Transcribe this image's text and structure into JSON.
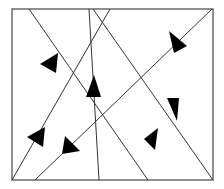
{
  "diagram": {
    "type": "directed-line-arrangement",
    "frame": {
      "x1": 12,
      "y1": 9,
      "x2": 213,
      "y2": 180,
      "stroke": "#555555"
    },
    "line_color": "#333333",
    "arrow_color": "#000000",
    "lines": [
      {
        "id": "line-1",
        "x1": 29,
        "y1": 9,
        "x2": 148,
        "y2": 180
      },
      {
        "id": "line-2",
        "x1": 89,
        "y1": 9,
        "x2": 99,
        "y2": 180
      },
      {
        "id": "line-3",
        "x1": 110,
        "y1": 9,
        "x2": 12,
        "y2": 180
      },
      {
        "id": "line-4",
        "x1": 93,
        "y1": 9,
        "x2": 213,
        "y2": 180
      },
      {
        "id": "line-5",
        "x1": 212,
        "y1": 9,
        "x2": 35,
        "y2": 180
      }
    ],
    "arrows": [
      {
        "id": "arrow-1",
        "points": "40,64 58,53 56,73"
      },
      {
        "id": "arrow-2",
        "points": "94,75 86,97 101,97"
      },
      {
        "id": "arrow-3",
        "points": "27,137 45,127 43,147"
      },
      {
        "id": "arrow-4",
        "points": "167,98 179,98 177,121"
      },
      {
        "id": "arrow-5",
        "points": "169,31 174,53 187,46"
      },
      {
        "id": "arrow-6",
        "points": "65,136 62,154 80,151"
      },
      {
        "id": "arrow-7",
        "points": "144,139 158,128 155,150"
      }
    ]
  }
}
